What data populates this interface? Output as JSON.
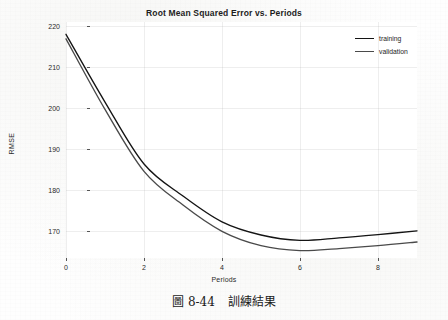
{
  "chart_data": {
    "type": "line",
    "title": "Root Mean Squared Error vs. Periods",
    "xlabel": "Periods",
    "ylabel": "RMSE",
    "x": [
      0,
      1,
      2,
      3,
      4,
      5,
      6,
      7,
      8,
      9
    ],
    "xlim": [
      0,
      9
    ],
    "ylim": [
      163.5,
      221.0
    ],
    "xticks": [
      0,
      2,
      4,
      6,
      8
    ],
    "xtick_labels": [
      "0",
      "2",
      "4",
      "6",
      "8"
    ],
    "yticks": [
      170,
      180,
      190,
      200,
      210,
      220
    ],
    "ytick_labels": [
      "170",
      "180",
      "190",
      "200",
      "210",
      "220"
    ],
    "grid": true,
    "legend_position": "upper right",
    "series": [
      {
        "name": "training",
        "color": "#141414",
        "values": [
          218.0,
          201.5,
          186.4,
          178.6,
          172.3,
          169.1,
          167.8,
          168.4,
          169.2,
          170.1
        ]
      },
      {
        "name": "validation",
        "color": "#4a4a4a",
        "values": [
          216.9,
          199.7,
          184.6,
          176.4,
          170.0,
          166.5,
          165.3,
          165.8,
          166.5,
          167.4
        ]
      }
    ]
  },
  "legend": {
    "items": [
      {
        "label": "training"
      },
      {
        "label": "validation"
      }
    ]
  },
  "caption": {
    "figure_number": "圖 8-44",
    "text": "訓練結果"
  },
  "colors": {
    "training": "#141414",
    "validation": "#4a4a4a",
    "grid": "#aaaaaa",
    "text": "#1d1d1d",
    "background": "#fefefe"
  }
}
